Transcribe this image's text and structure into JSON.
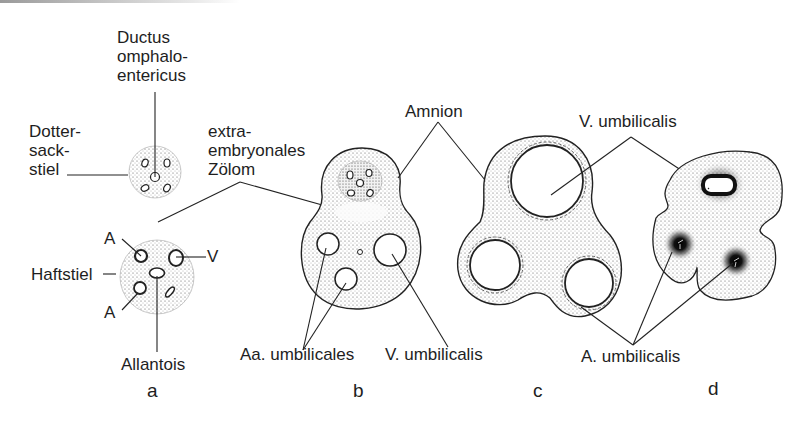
{
  "figure": {
    "panels": [
      {
        "id": "a",
        "label": "a"
      },
      {
        "id": "b",
        "label": "b"
      },
      {
        "id": "c",
        "label": "c"
      },
      {
        "id": "d",
        "label": "d"
      }
    ],
    "labels": {
      "ductus": "Ductus\nomphalo-\nentericus",
      "dottersackstiel": "Dotter-\nsack-\nstiel",
      "extra_zoelom": "extra-\nembryonales\nZölom",
      "haftstiel": "Haftstiel",
      "a_upper": "A",
      "a_lower": "A",
      "v": "V",
      "allantois": "Allantois",
      "aa_umbilicales": "Aa. umbilicales",
      "v_umbilicalis_b": "V. umbilicalis",
      "amnion": "Amnion",
      "v_umbilicalis_top": "V. umbilicalis",
      "a_umbilicalis": "A. umbilicalis"
    }
  }
}
